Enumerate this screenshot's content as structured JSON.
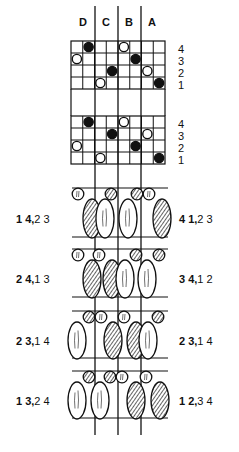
{
  "columns": [
    "D",
    "C",
    "B",
    "A"
  ],
  "grid": {
    "x0": 71,
    "x1": 165,
    "cols": 8,
    "rowH": 12,
    "colLines": [
      95,
      118,
      141
    ],
    "grids": [
      {
        "top": 41,
        "rowLabels": [
          "4",
          "3",
          "2",
          "1"
        ],
        "dots": [
          {
            "row": 0,
            "col": 1,
            "fill": "filled"
          },
          {
            "row": 0,
            "col": 4,
            "fill": "open"
          },
          {
            "row": 1,
            "col": 0,
            "fill": "open"
          },
          {
            "row": 1,
            "col": 5,
            "fill": "filled"
          },
          {
            "row": 2,
            "col": 3,
            "fill": "filled"
          },
          {
            "row": 2,
            "col": 6,
            "fill": "open"
          },
          {
            "row": 3,
            "col": 2,
            "fill": "open"
          },
          {
            "row": 3,
            "col": 7,
            "fill": "filled"
          }
        ]
      },
      {
        "top": 116,
        "rowLabels": [
          "4",
          "3",
          "2",
          "1"
        ],
        "dots": [
          {
            "row": 0,
            "col": 1,
            "fill": "filled"
          },
          {
            "row": 0,
            "col": 4,
            "fill": "open"
          },
          {
            "row": 1,
            "col": 3,
            "fill": "filled"
          },
          {
            "row": 1,
            "col": 6,
            "fill": "open"
          },
          {
            "row": 2,
            "col": 0,
            "fill": "open"
          },
          {
            "row": 2,
            "col": 5,
            "fill": "filled"
          },
          {
            "row": 3,
            "col": 2,
            "fill": "open"
          },
          {
            "row": 3,
            "col": 7,
            "fill": "filled"
          }
        ]
      }
    ]
  },
  "bands": [
    {
      "top": 188,
      "bottom": 237,
      "left_label": {
        "bold": "1 4,",
        "rest": "2 3"
      },
      "right_label": {
        "bold": "4 1,",
        "rest": "2 3"
      },
      "small": [
        {
          "x": 78,
          "fill": "open"
        },
        {
          "x": 111,
          "fill": "hatched"
        },
        {
          "x": 137,
          "fill": "hatched"
        },
        {
          "x": 149,
          "fill": "open"
        }
      ],
      "big": [
        {
          "x": 92,
          "fill": "hatched"
        },
        {
          "x": 105,
          "fill": "plain"
        },
        {
          "x": 128,
          "fill": "plain"
        },
        {
          "x": 162,
          "fill": "hatched"
        }
      ]
    },
    {
      "top": 249,
      "bottom": 297,
      "left_label": {
        "bold": "2 4,",
        "rest": "1 3"
      },
      "right_label": {
        "bold": "3 4,",
        "rest": "1 2"
      },
      "small": [
        {
          "x": 78,
          "fill": "open"
        },
        {
          "x": 99,
          "fill": "open"
        },
        {
          "x": 136,
          "fill": "hatched"
        },
        {
          "x": 159,
          "fill": "hatched"
        }
      ],
      "big": [
        {
          "x": 92,
          "fill": "hatched"
        },
        {
          "x": 112,
          "fill": "hatched"
        },
        {
          "x": 125,
          "fill": "plain"
        },
        {
          "x": 147,
          "fill": "plain"
        }
      ]
    },
    {
      "top": 311,
      "bottom": 358,
      "left_label": {
        "bold": "2 3,",
        "rest": "1 4"
      },
      "right_label": {
        "bold": "2 3,",
        "rest": "1 4"
      },
      "small": [
        {
          "x": 89,
          "fill": "hatched"
        },
        {
          "x": 101,
          "fill": "open"
        },
        {
          "x": 124,
          "fill": "open"
        },
        {
          "x": 158,
          "fill": "hatched"
        }
      ],
      "big": [
        {
          "x": 77,
          "fill": "plain"
        },
        {
          "x": 113,
          "fill": "hatched"
        },
        {
          "x": 136,
          "fill": "hatched"
        },
        {
          "x": 148,
          "fill": "plain"
        }
      ]
    },
    {
      "top": 371,
      "bottom": 418,
      "left_label": {
        "bold": "1 3,",
        "rest": "2 4"
      },
      "right_label": {
        "bold": "1 2,",
        "rest": "3 4"
      },
      "small": [
        {
          "x": 89,
          "fill": "hatched"
        },
        {
          "x": 110,
          "fill": "hatched"
        },
        {
          "x": 122,
          "fill": "open"
        },
        {
          "x": 146,
          "fill": "open"
        }
      ],
      "big": [
        {
          "x": 77,
          "fill": "plain"
        },
        {
          "x": 100,
          "fill": "plain"
        },
        {
          "x": 136,
          "fill": "hatched"
        },
        {
          "x": 160,
          "fill": "hatched"
        }
      ]
    }
  ],
  "colors": {
    "ink": "#111111",
    "paper": "#ffffff"
  }
}
